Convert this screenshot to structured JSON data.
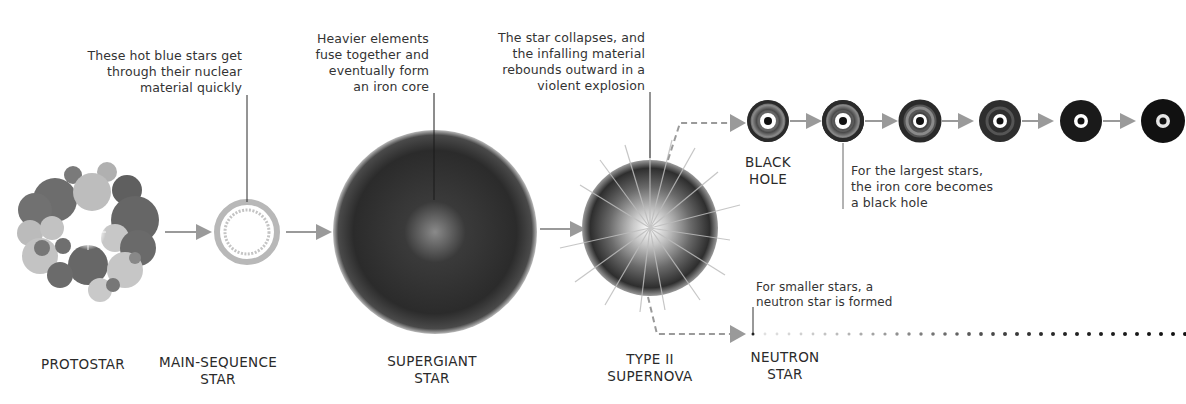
{
  "diagram": {
    "type": "stellar-evolution-timeline",
    "stages": [
      {
        "id": "protostar",
        "label": "PROTOSTAR"
      },
      {
        "id": "main-sequence",
        "label": "MAIN-SEQUENCE\nSTAR"
      },
      {
        "id": "supergiant",
        "label": "SUPERGIANT\nSTAR"
      },
      {
        "id": "supernova",
        "label": "TYPE II\nSUPERNOVA"
      },
      {
        "id": "black-hole",
        "label": "BLACK\nHOLE"
      },
      {
        "id": "neutron-star",
        "label": "NEUTRON\nSTAR"
      }
    ],
    "annotations": [
      {
        "target": "main-sequence",
        "text": "These hot blue stars get\nthrough their nuclear\nmaterial quickly"
      },
      {
        "target": "supergiant",
        "text": "Heavier elements\nfuse together and\neventually form\nan iron core"
      },
      {
        "target": "supernova",
        "text": "The star collapses, and\nthe infalling material\nrebounds outward in a\nviolent explosion"
      },
      {
        "target": "black-hole",
        "text": "For the largest stars,\nthe iron core becomes\na black hole"
      },
      {
        "target": "neutron-star",
        "text": "For smaller stars, a\nneutron star is formed"
      }
    ],
    "black_hole_sequence_count": 6,
    "neutron_dots_count": 27,
    "colors": {
      "arrow": "#9a9a9a",
      "leader_line": "#2a2a2a",
      "text": "#333333",
      "star_dark": "#2b2b2b"
    }
  }
}
